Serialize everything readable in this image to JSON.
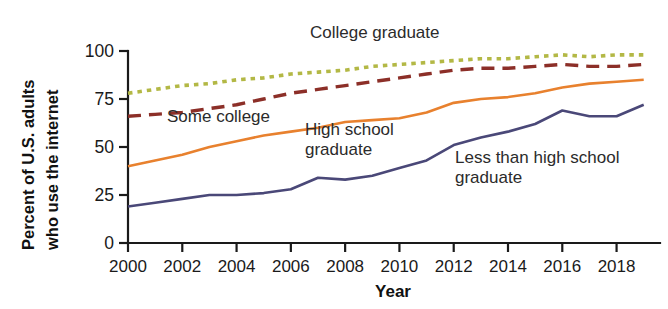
{
  "chart_data": {
    "type": "line",
    "title": "",
    "xlabel": "Year",
    "ylabel": "Percent of U.S. adults who use the internet",
    "ylabel_line1": "Percent of U.S. adults",
    "ylabel_line2": "who use the internet",
    "xlim": [
      2000,
      2019.6
    ],
    "ylim": [
      0,
      100
    ],
    "grid": false,
    "legend_position": "inline-annotations",
    "x_tick_labels": [
      "2000",
      "2002",
      "2004",
      "2006",
      "2008",
      "2010",
      "2012",
      "2014",
      "2016",
      "2018"
    ],
    "x_ticks": [
      2000,
      2002,
      2004,
      2006,
      2008,
      2010,
      2012,
      2014,
      2016,
      2018
    ],
    "y_tick_labels": [
      "0",
      "25",
      "50",
      "75",
      "100"
    ],
    "y_ticks": [
      0,
      25,
      50,
      75,
      100
    ],
    "x": [
      2000,
      2001,
      2002,
      2003,
      2004,
      2005,
      2006,
      2007,
      2008,
      2009,
      2010,
      2011,
      2012,
      2013,
      2014,
      2015,
      2016,
      2017,
      2018,
      2019
    ],
    "series": [
      {
        "name": "College graduate",
        "label": "College graduate",
        "color": "#b3b845",
        "style": "dotted",
        "values": [
          78,
          80,
          82,
          83,
          85,
          86,
          88,
          89,
          90,
          92,
          93,
          94,
          95,
          96,
          96,
          97,
          98,
          97,
          98,
          98
        ]
      },
      {
        "name": "Some college",
        "label": "Some college",
        "color": "#8c2f28",
        "style": "dashed",
        "values": [
          66,
          67,
          68,
          70,
          72,
          75,
          78,
          80,
          82,
          84,
          86,
          88,
          90,
          91,
          91,
          92,
          93,
          92,
          92,
          93
        ]
      },
      {
        "name": "High school graduate",
        "label": "High school graduate",
        "label_line1": "High school",
        "label_line2": "graduate",
        "color": "#e8812e",
        "style": "solid",
        "values": [
          40,
          43,
          46,
          50,
          53,
          56,
          58,
          60,
          63,
          64,
          65,
          68,
          73,
          75,
          76,
          78,
          81,
          83,
          84,
          85
        ]
      },
      {
        "name": "Less than high school graduate",
        "label": "Less than high school graduate",
        "label_line1": "Less than high school",
        "label_line2": "graduate",
        "color": "#4a4878",
        "style": "solid",
        "values": [
          19,
          21,
          23,
          25,
          25,
          26,
          28,
          34,
          33,
          35,
          39,
          43,
          51,
          55,
          58,
          62,
          69,
          66,
          66,
          72
        ]
      }
    ],
    "annotations": [
      {
        "text": "College graduate",
        "x_px": 310,
        "y_px": 38
      },
      {
        "text": "Some college",
        "x_px": 167,
        "y_px": 122
      },
      {
        "text": "High school graduate",
        "x_px": 305,
        "y_px": 135
      },
      {
        "text": "Less than high school graduate",
        "x_px": 455,
        "y_px": 163
      }
    ]
  }
}
